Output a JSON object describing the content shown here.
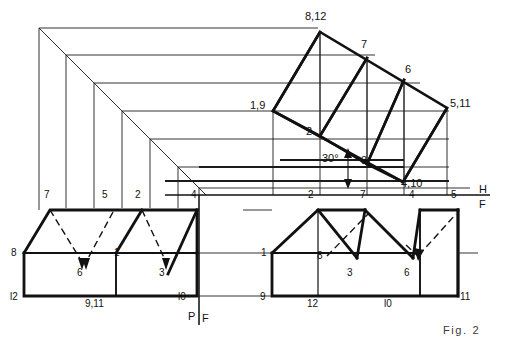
{
  "figure": {
    "caption": "Fig. 2",
    "angle_annotation": "30°",
    "reference_lines": {
      "horizontal_frontal_top": "H",
      "horizontal_frontal_bottom": "F",
      "profile_frontal_left": "P",
      "profile_frontal_right": "F"
    }
  },
  "views": {
    "profile_view": {
      "name": "profile-view",
      "point_labels": [
        {
          "id": "p7",
          "text": "7",
          "x": 46,
          "y": 197
        },
        {
          "id": "p5",
          "text": "5",
          "x": 104,
          "y": 197
        },
        {
          "id": "p2",
          "text": "2",
          "x": 137,
          "y": 197
        },
        {
          "id": "p4",
          "text": "4",
          "x": 193,
          "y": 197
        },
        {
          "id": "p8",
          "text": "8",
          "x": 14,
          "y": 254
        },
        {
          "id": "p6",
          "text": "6",
          "x": 79,
          "y": 274
        },
        {
          "id": "p1",
          "text": "1",
          "x": 116,
          "y": 254
        },
        {
          "id": "p3",
          "text": "3",
          "x": 161,
          "y": 274
        },
        {
          "id": "p12",
          "text": "l2",
          "x": 12,
          "y": 300
        },
        {
          "id": "p911",
          "text": "9,11",
          "x": 89,
          "y": 305
        },
        {
          "id": "p10",
          "text": "l0",
          "x": 180,
          "y": 300
        }
      ]
    },
    "front_view": {
      "name": "front-view",
      "point_labels": [
        {
          "id": "f2",
          "text": "2",
          "x": 310,
          "y": 197
        },
        {
          "id": "f7",
          "text": "7",
          "x": 362,
          "y": 197
        },
        {
          "id": "f4",
          "text": "4",
          "x": 411,
          "y": 197
        },
        {
          "id": "f5",
          "text": "5",
          "x": 452,
          "y": 197
        },
        {
          "id": "f1",
          "text": "1",
          "x": 263,
          "y": 254
        },
        {
          "id": "f8",
          "text": "8",
          "x": 318,
          "y": 258
        },
        {
          "id": "f3",
          "text": "3",
          "x": 349,
          "y": 274
        },
        {
          "id": "f6",
          "text": "6",
          "x": 405,
          "y": 274
        },
        {
          "id": "f9",
          "text": "9",
          "x": 262,
          "y": 300
        },
        {
          "id": "f12",
          "text": "12",
          "x": 310,
          "y": 305
        },
        {
          "id": "f10",
          "text": "l0",
          "x": 386,
          "y": 305
        },
        {
          "id": "f11",
          "text": "11",
          "x": 452,
          "y": 300
        }
      ]
    },
    "auxiliary_view": {
      "name": "auxiliary-view",
      "point_labels": [
        {
          "id": "a812",
          "text": "8,12",
          "x": 307,
          "y": 19
        },
        {
          "id": "a7",
          "text": "7",
          "x": 362,
          "y": 46
        },
        {
          "id": "a6",
          "text": "6",
          "x": 406,
          "y": 71
        },
        {
          "id": "a511",
          "text": "5,11",
          "x": 452,
          "y": 104
        },
        {
          "id": "a19",
          "text": "1,9",
          "x": 252,
          "y": 106
        },
        {
          "id": "a2",
          "text": "2",
          "x": 307,
          "y": 132
        },
        {
          "id": "a3",
          "text": "3",
          "x": 362,
          "y": 161
        },
        {
          "id": "a410",
          "text": "4,10",
          "x": 403,
          "y": 184
        },
        {
          "id": "a30",
          "text": "30°",
          "x": 327,
          "y": 159
        }
      ]
    }
  },
  "style": {
    "line_color": "#111111",
    "thin_line_color": "#2b2b2b",
    "background": "#ffffff"
  }
}
